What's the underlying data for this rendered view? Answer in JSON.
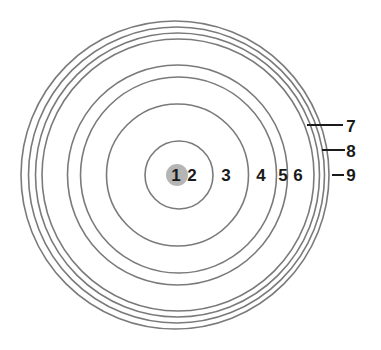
{
  "diagram": {
    "type": "concentric-circles",
    "colors": {
      "background": "#ffffff",
      "ring_stroke": "#7a7a7a",
      "center_dot": "#b5b5b5",
      "label": "#1a1a1a"
    },
    "center_dot": {
      "cx": 177,
      "cy": 175,
      "r": 11
    },
    "rings": [
      {
        "id": "ring-1",
        "cx": 179,
        "cy": 175,
        "r": 34
      },
      {
        "id": "ring-2",
        "cx": 177.5,
        "cy": 175,
        "r": 71
      },
      {
        "id": "ring-3",
        "cx": 178.5,
        "cy": 175,
        "r": 98
      },
      {
        "id": "ring-4",
        "cx": 177.5,
        "cy": 175,
        "r": 110
      },
      {
        "id": "ring-5",
        "cx": 178,
        "cy": 175,
        "r": 136
      },
      {
        "id": "ring-6",
        "cx": 177.5,
        "cy": 175,
        "r": 142
      },
      {
        "id": "ring-7",
        "cx": 176.5,
        "cy": 175,
        "r": 148
      },
      {
        "id": "ring-8",
        "cx": 175,
        "cy": 175,
        "r": 154
      }
    ],
    "labels": [
      {
        "text": "1",
        "x": 176,
        "y": 181
      },
      {
        "text": "2",
        "x": 192,
        "y": 181
      },
      {
        "text": "3",
        "x": 226,
        "y": 181
      },
      {
        "text": "4",
        "x": 261,
        "y": 181
      },
      {
        "text": "5",
        "x": 283,
        "y": 181
      },
      {
        "text": "6",
        "x": 298,
        "y": 181
      },
      {
        "text": "7",
        "x": 351,
        "y": 132
      },
      {
        "text": "8",
        "x": 351,
        "y": 157
      },
      {
        "text": "9",
        "x": 351,
        "y": 181
      }
    ],
    "leaders": [
      {
        "label": "7",
        "x1": 307,
        "y1": 125,
        "x2": 343,
        "y2": 125
      },
      {
        "label": "8",
        "x1": 322,
        "y1": 150,
        "x2": 345,
        "y2": 150
      },
      {
        "label": "9",
        "x1": 332,
        "y1": 175,
        "x2": 344,
        "y2": 175
      }
    ]
  }
}
